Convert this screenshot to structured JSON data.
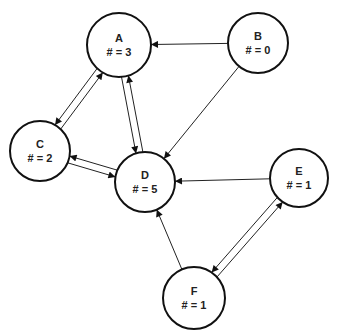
{
  "diagram": {
    "type": "directed-graph",
    "nodes": [
      {
        "id": "A",
        "name": "A",
        "count_label": "# = 3",
        "cx": 119,
        "cy": 45,
        "r": 32
      },
      {
        "id": "B",
        "name": "B",
        "count_label": "# = 0",
        "cx": 258,
        "cy": 43,
        "r": 30
      },
      {
        "id": "C",
        "name": "C",
        "count_label": "# = 2",
        "cx": 40,
        "cy": 151,
        "r": 30
      },
      {
        "id": "D",
        "name": "D",
        "count_label": "# = 5",
        "cx": 145,
        "cy": 182,
        "r": 30
      },
      {
        "id": "E",
        "name": "E",
        "count_label": "# = 1",
        "cx": 299,
        "cy": 178,
        "r": 29
      },
      {
        "id": "F",
        "name": "F",
        "count_label": "# = 1",
        "cx": 194,
        "cy": 298,
        "r": 31
      }
    ],
    "edges": [
      {
        "from": "B",
        "to": "A"
      },
      {
        "from": "B",
        "to": "D"
      },
      {
        "from": "A",
        "to": "C"
      },
      {
        "from": "C",
        "to": "A"
      },
      {
        "from": "A",
        "to": "D"
      },
      {
        "from": "D",
        "to": "A"
      },
      {
        "from": "C",
        "to": "D"
      },
      {
        "from": "D",
        "to": "C"
      },
      {
        "from": "E",
        "to": "D"
      },
      {
        "from": "F",
        "to": "D"
      },
      {
        "from": "E",
        "to": "F"
      },
      {
        "from": "F",
        "to": "E"
      }
    ]
  }
}
